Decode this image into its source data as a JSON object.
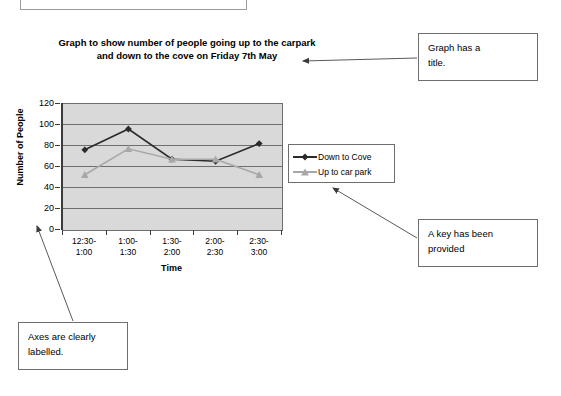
{
  "chart_data": {
    "type": "line",
    "title": "Graph to show number of people going up to the carpark and down to the cove on Friday 7th May",
    "title_line1": "Graph to show number of people going up to the carpark",
    "title_line2": "and down to the cove on Friday 7th May",
    "xlabel": "Time",
    "ylabel": "Number of People",
    "categories": [
      "12:30-1:00",
      "1:00-1:30",
      "1:30-2:00",
      "2:00-2:30",
      "2:30-3:00"
    ],
    "category_lines": [
      [
        "12:30-",
        "1:00"
      ],
      [
        "1:00-",
        "1:30"
      ],
      [
        "1:30-",
        "2:00"
      ],
      [
        "2:00-",
        "2:30"
      ],
      [
        "2:30-",
        "3:00"
      ]
    ],
    "series": [
      {
        "name": "Down to Cove",
        "color": "#2b2b2b",
        "marker": "diamond",
        "values": [
          76,
          96,
          67,
          65,
          82
        ]
      },
      {
        "name": "Up to car park",
        "color": "#a8a8a8",
        "marker": "triangle",
        "values": [
          52,
          77,
          67,
          67,
          52
        ]
      }
    ],
    "ylim": [
      0,
      120
    ],
    "yticks": [
      0,
      20,
      40,
      60,
      80,
      100,
      120
    ],
    "ytick_labels": [
      "0",
      "20",
      "40",
      "60",
      "80",
      "100",
      "120"
    ],
    "grid": true,
    "legend_position": "right",
    "plot_background": "#d9d9d9",
    "gridline_color": "#6e6e6e"
  },
  "legend": {
    "entries": [
      {
        "label": "Down to Cove"
      },
      {
        "label": "Up to car park"
      }
    ]
  },
  "annotations": [
    {
      "id": "title-note",
      "line1": "Graph has a",
      "line2": "title."
    },
    {
      "id": "key-note",
      "line1": "A key has been",
      "line2": "provided"
    },
    {
      "id": "axes-note",
      "line1": "Axes are clearly",
      "line2": "labelled."
    }
  ]
}
